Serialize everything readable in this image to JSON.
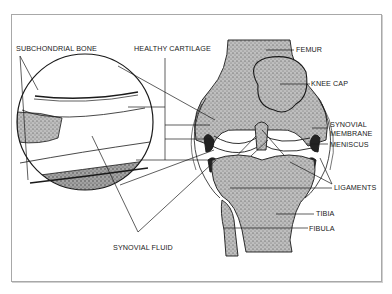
{
  "figure": {
    "colors": {
      "line": "#1a1a1a",
      "bone_stipple": "#8a8a8a",
      "frame": "#a8a8a8",
      "background": "#ffffff"
    }
  },
  "labels": {
    "subchondral_bone": "SUBCHONDRIAL BONE",
    "healthy_cartilage": "HEALTHY CARTILAGE",
    "femur": "FEMUR",
    "knee_cap": "KNEE CAP",
    "synovial_membrane_1": "SYNOVIAL",
    "synovial_membrane_2": "MEMBRANE",
    "meniscus": "MENISCUS",
    "ligaments": "LIGAMENTS",
    "tibia": "TIBIA",
    "fibula": "FIBULA",
    "synovial_fluid": "SYNOVIAL FLUID"
  }
}
